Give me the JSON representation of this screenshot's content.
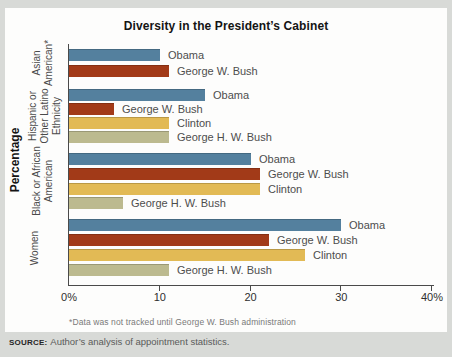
{
  "chart_data": {
    "type": "bar",
    "orientation": "horizontal",
    "title": "Diversity in the President’s Cabinet",
    "axis_label": "Percentage",
    "xlabel": "",
    "ylabel": "Percentage",
    "xlim": [
      0,
      40
    ],
    "grid": false,
    "footnote": "*Data was not tracked until George W. Bush administration",
    "x_ticks": [
      {
        "value": 0,
        "label": "0%"
      },
      {
        "value": 10,
        "label": "10"
      },
      {
        "value": 20,
        "label": "20"
      },
      {
        "value": 30,
        "label": "30"
      },
      {
        "value": 40,
        "label": "40%"
      }
    ],
    "series_colors": {
      "Obama": "#54809e",
      "George W. Bush": "#a23a18",
      "Clinton": "#e2ba55",
      "George H. W. Bush": "#bcba8f"
    },
    "groups": [
      {
        "category": "Asian American*",
        "category_lines": [
          "Asian",
          "American*"
        ],
        "bars": [
          {
            "label": "Obama",
            "value": 10
          },
          {
            "label": "George W. Bush",
            "value": 11
          }
        ]
      },
      {
        "category": "Hispanic or Other Latino Ethnicity",
        "category_lines": [
          "Hispanic or",
          "Other Latino",
          "Ethnicity"
        ],
        "bars": [
          {
            "label": "Obama",
            "value": 15
          },
          {
            "label": "George W. Bush",
            "value": 5
          },
          {
            "label": "Clinton",
            "value": 11
          },
          {
            "label": "George H. W. Bush",
            "value": 11
          }
        ]
      },
      {
        "category": "Black or African American",
        "category_lines": [
          "Black or African",
          "American"
        ],
        "bars": [
          {
            "label": "Obama",
            "value": 20
          },
          {
            "label": "George W. Bush",
            "value": 21
          },
          {
            "label": "Clinton",
            "value": 21
          },
          {
            "label": "George H. W. Bush",
            "value": 6
          }
        ]
      },
      {
        "category": "Women",
        "category_lines": [
          "Women"
        ],
        "bars": [
          {
            "label": "Obama",
            "value": 30
          },
          {
            "label": "George W. Bush",
            "value": 22
          },
          {
            "label": "Clinton",
            "value": 26
          },
          {
            "label": "George H. W. Bush",
            "value": 11
          }
        ]
      }
    ]
  },
  "source": {
    "label": "SOURCE:",
    "text": "Author’s analysis of appointment statistics."
  }
}
